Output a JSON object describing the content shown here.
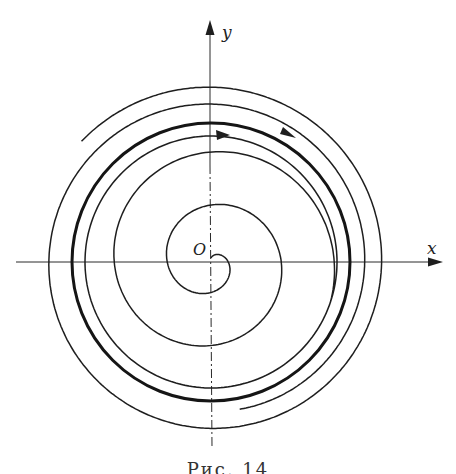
{
  "figure": {
    "labels": {
      "x_axis": "x",
      "y_axis": "y",
      "origin": "O"
    },
    "caption": "Рис. 14",
    "caption_note": "caption partially cut off at bottom edge",
    "colors": {
      "background": "#ffffff",
      "ink": "#1e1e1e"
    }
  },
  "diagram": {
    "type": "phase portrait",
    "center": [
      211,
      262
    ],
    "limit_cycle_radius": 139,
    "direction": "clockwise",
    "arrows": 2
  }
}
